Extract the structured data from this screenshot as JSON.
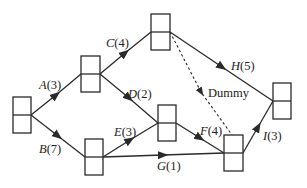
{
  "diagram": {
    "type": "activity-network",
    "nodes": [
      {
        "id": "n1",
        "x": 13,
        "y": 97,
        "w": 18,
        "h": 36
      },
      {
        "id": "n2",
        "x": 81,
        "y": 56,
        "w": 19,
        "h": 36
      },
      {
        "id": "n3",
        "x": 151,
        "y": 14,
        "w": 19,
        "h": 36
      },
      {
        "id": "n4",
        "x": 158,
        "y": 105,
        "w": 18,
        "h": 36
      },
      {
        "id": "n5",
        "x": 85,
        "y": 139,
        "w": 18,
        "h": 36
      },
      {
        "id": "n6",
        "x": 224,
        "y": 135,
        "w": 19,
        "h": 36
      },
      {
        "id": "n7",
        "x": 273,
        "y": 83,
        "w": 18,
        "h": 36
      }
    ],
    "activities": [
      {
        "letter": "A",
        "duration": "(3)",
        "from": "n1",
        "to": "n2"
      },
      {
        "letter": "B",
        "duration": "(7)",
        "from": "n1",
        "to": "n5"
      },
      {
        "letter": "C",
        "duration": "(4)",
        "from": "n2",
        "to": "n3"
      },
      {
        "letter": "D",
        "duration": "(2)",
        "from": "n2",
        "to": "n4"
      },
      {
        "letter": "E",
        "duration": "(3)",
        "from": "n5",
        "to": "n4"
      },
      {
        "letter": "F",
        "duration": "(4)",
        "from": "n4",
        "to": "n6"
      },
      {
        "letter": "G",
        "duration": "(1)",
        "from": "n5",
        "to": "n6"
      },
      {
        "letter": "H",
        "duration": "(5)",
        "from": "n3",
        "to": "n7"
      },
      {
        "letter": "I",
        "duration": "(3)",
        "from": "n6",
        "to": "n7"
      }
    ],
    "dummy": {
      "label": "Dummy",
      "from": "n3",
      "to": "n6"
    }
  }
}
